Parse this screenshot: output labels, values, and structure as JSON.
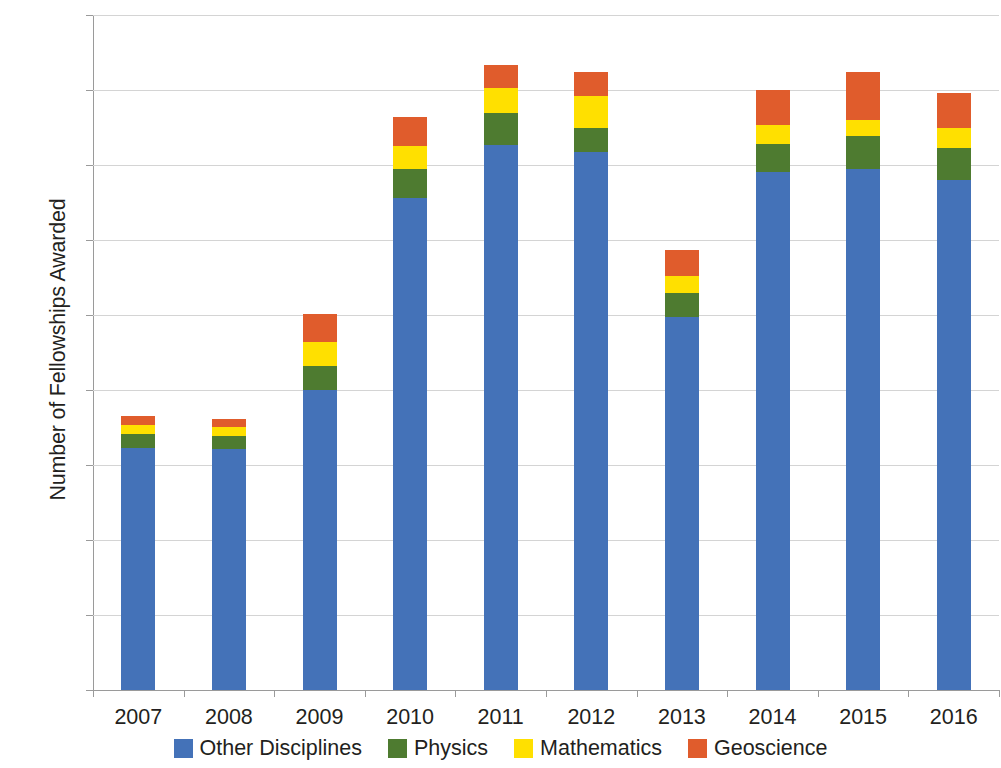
{
  "chart_data": {
    "type": "bar",
    "subtype": "stacked-bar",
    "title": "",
    "xlabel": "",
    "ylabel": "Number of Fellowships Awarded",
    "ylim": [
      0,
      2250
    ],
    "ytick_step": 250,
    "ytick_labels": [
      "2250",
      "2000",
      "1750",
      "1500",
      "1250",
      "1000",
      "750",
      "500",
      "250",
      "0"
    ],
    "ytick_values": [
      2250,
      2000,
      1750,
      1500,
      1250,
      1000,
      750,
      500,
      250,
      0
    ],
    "categories": [
      "2007",
      "2008",
      "2009",
      "2010",
      "2011",
      "2012",
      "2013",
      "2014",
      "2015",
      "2016"
    ],
    "grid": true,
    "legend_position": "bottom",
    "stack_order_bottom_to_top": [
      "Other Disciplines",
      "Physics",
      "Mathematics",
      "Geoscience"
    ],
    "series": [
      {
        "name": "Other Disciplines",
        "color": "#4472b8",
        "values": [
          808,
          803,
          1000,
          1640,
          1818,
          1793,
          1243,
          1727,
          1737,
          1700
        ]
      },
      {
        "name": "Physics",
        "color": "#4e7b30",
        "values": [
          47,
          45,
          80,
          97,
          105,
          80,
          80,
          93,
          110,
          107
        ]
      },
      {
        "name": "Mathematics",
        "color": "#ffe000",
        "values": [
          30,
          30,
          80,
          76,
          85,
          107,
          57,
          63,
          53,
          67
        ]
      },
      {
        "name": "Geoscience",
        "color": "#e05c2c",
        "values": [
          28,
          25,
          95,
          97,
          75,
          80,
          87,
          117,
          160,
          117
        ]
      }
    ],
    "totals": [
      913,
      903,
      1255,
      1910,
      2083,
      2060,
      1467,
      2000,
      2060,
      1991
    ]
  },
  "legend": {
    "items": [
      {
        "label": "Other Disciplines",
        "color": "#4472b8",
        "swatch": "legend-swatch-other-disciplines"
      },
      {
        "label": "Physics",
        "color": "#4e7b30",
        "swatch": "legend-swatch-physics"
      },
      {
        "label": "Mathematics",
        "color": "#ffe000",
        "swatch": "legend-swatch-mathematics"
      },
      {
        "label": "Geoscience",
        "color": "#e05c2c",
        "swatch": "legend-swatch-geoscience"
      }
    ]
  },
  "axes": {
    "y_title": "Number of Fellowships Awarded",
    "grid_color": "#d4d4d4",
    "axis_color": "#9a9a9a"
  }
}
